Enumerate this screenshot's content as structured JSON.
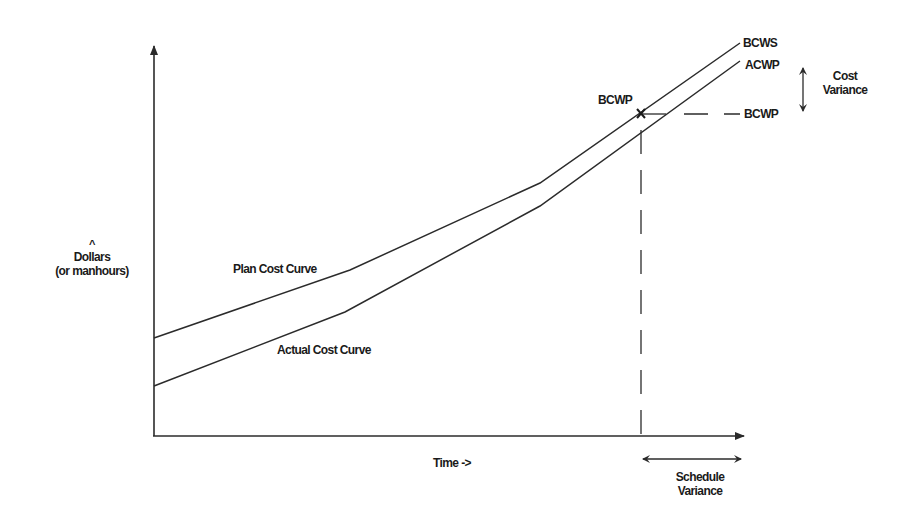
{
  "diagram": {
    "axes": {
      "y_label_caret": "^",
      "y_label_line1": "Dollars",
      "y_label_line2": "(or manhours)",
      "x_label": "Time ->"
    },
    "curves": {
      "plan": {
        "label": "Plan Cost Curve",
        "end_label": "BCWS",
        "points": [
          [
            154,
            338
          ],
          [
            350,
            270
          ],
          [
            540,
            183
          ],
          [
            740,
            43
          ]
        ]
      },
      "actual": {
        "label": "Actual Cost Curve",
        "end_label": "ACWP",
        "points": [
          [
            154,
            386
          ],
          [
            345,
            312
          ],
          [
            540,
            206
          ],
          [
            740,
            61
          ]
        ]
      }
    },
    "markers": {
      "bcwp_point_label": "BCWP",
      "bcwp_point_symbol": "X",
      "bcwp_right_label": "BCWP"
    },
    "variances": {
      "cost_line1": "Cost",
      "cost_line2": "Variance",
      "schedule_line1": "Schedule",
      "schedule_line2": "Variance"
    },
    "colors": {
      "line": "#2b2b2b",
      "text": "#1a1a1a",
      "background": "#ffffff"
    }
  }
}
